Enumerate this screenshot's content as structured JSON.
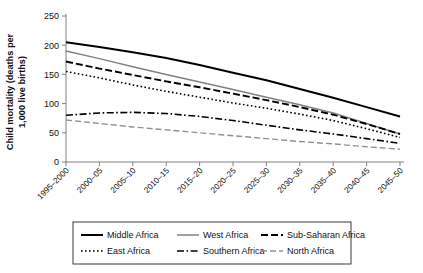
{
  "chart_data": {
    "type": "line",
    "title": "",
    "xlabel": "",
    "ylabel": "Child mortality (deaths per",
    "ylabel_line2": "1,000 live births)",
    "ylim": [
      0,
      250
    ],
    "yticks": [
      0,
      50,
      100,
      150,
      200,
      250
    ],
    "grid": false,
    "legend_position": "bottom",
    "categories": [
      "1995–2000",
      "2000–05",
      "2005–10",
      "2010–15",
      "2015–20",
      "2020–25",
      "2025–30",
      "2030–35",
      "2035–40",
      "2040–45",
      "2045–50"
    ],
    "series": [
      {
        "name": "Middle Africa",
        "values": [
          205,
          197,
          188,
          178,
          166,
          153,
          140,
          125,
          110,
          94,
          78
        ],
        "color": "#000000",
        "style": "solid",
        "width": 2.0,
        "dash": ""
      },
      {
        "name": "West Africa",
        "values": [
          190,
          177,
          163,
          150,
          137,
          124,
          111,
          98,
          84,
          66,
          48
        ],
        "color": "#808080",
        "style": "solid",
        "width": 1.5,
        "dash": ""
      },
      {
        "name": "Sub-Saharan Africa",
        "values": [
          172,
          160,
          149,
          138,
          128,
          117,
          106,
          94,
          81,
          65,
          48
        ],
        "color": "#000000",
        "style": "dashed",
        "width": 1.9,
        "dash": "7,3"
      },
      {
        "name": "East Africa",
        "values": [
          155,
          144,
          132,
          121,
          111,
          101,
          92,
          82,
          71,
          57,
          42
        ],
        "color": "#000000",
        "style": "dotted",
        "width": 1.6,
        "dash": "1.6,2.4"
      },
      {
        "name": "Southern Africa",
        "values": [
          80,
          84,
          85,
          83,
          78,
          71,
          63,
          55,
          48,
          40,
          32
        ],
        "color": "#000000",
        "style": "dash-dot",
        "width": 1.6,
        "dash": "7,2.5,1.6,2.5"
      },
      {
        "name": "North Africa",
        "values": [
          72,
          66,
          60,
          55,
          50,
          45,
          40,
          35,
          31,
          26,
          22
        ],
        "color": "#909090",
        "style": "dashed",
        "width": 1.4,
        "dash": "6,3"
      }
    ]
  },
  "legend": {
    "rows": [
      [
        "Middle Africa",
        "West Africa",
        "Sub-Saharan Africa"
      ],
      [
        "East Africa",
        "Southern Africa",
        "North Africa"
      ]
    ]
  }
}
